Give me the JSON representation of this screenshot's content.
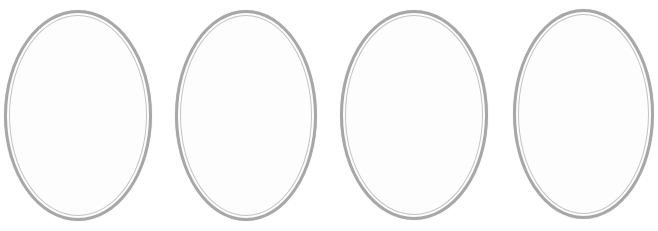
{
  "canvas": {
    "width": 658,
    "height": 231,
    "background_color": "#ffffff"
  },
  "ovals": {
    "count": 4,
    "outer_border_color": "#a7a7a7",
    "outer_border_width": 3,
    "inner_border_color": "#c3c3c3",
    "inner_border_width": 1,
    "ring_gap": 2,
    "fill_color": "#fdfdfd",
    "items": [
      {
        "name": "oval-1",
        "left": 4,
        "top": 10,
        "width": 148,
        "height": 211
      },
      {
        "name": "oval-2",
        "left": 175,
        "top": 10,
        "width": 142,
        "height": 211
      },
      {
        "name": "oval-3",
        "left": 340,
        "top": 10,
        "width": 148,
        "height": 210
      },
      {
        "name": "oval-4",
        "left": 513,
        "top": 9,
        "width": 141,
        "height": 210
      }
    ]
  }
}
